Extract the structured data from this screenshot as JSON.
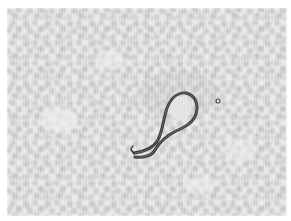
{
  "image": {
    "description": "Grayscale micrograph of a blood smear showing a single looped filarial worm (microfilaria) among red blood cells",
    "palette": {
      "background": "#ffffff",
      "field": "#e6e6e6",
      "cells": "#c4c4c4",
      "worm": "#3a3a3a"
    }
  }
}
